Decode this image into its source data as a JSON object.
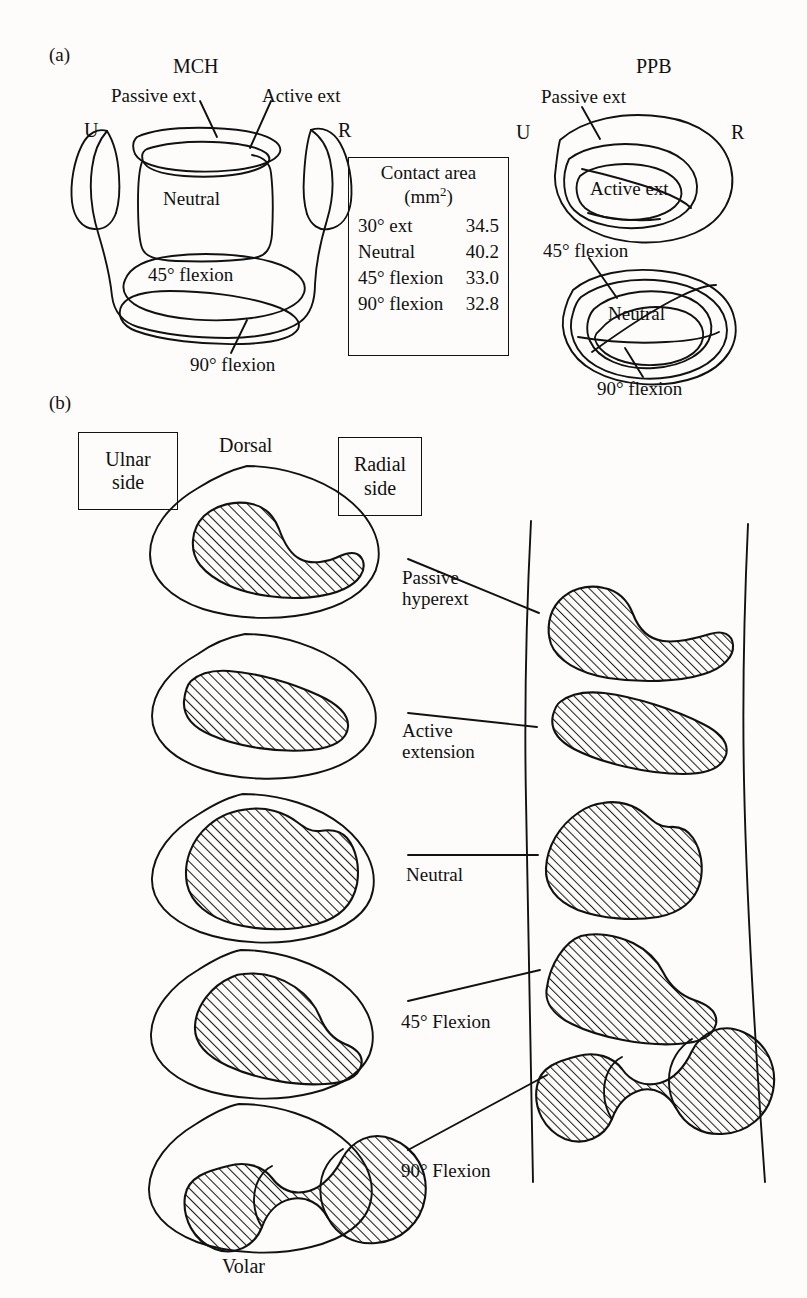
{
  "figure": {
    "panel_a_tag": "(a)",
    "panel_b_tag": "(b)"
  },
  "panel_a": {
    "left_title": "MCH",
    "right_title": "PPB",
    "mch": {
      "ulnar_marker": "U",
      "radial_marker": "R",
      "passive_ext": "Passive ext",
      "active_ext": "Active ext",
      "neutral": "Neutral",
      "flexion_45": "45° flexion",
      "flexion_90": "90° flexion"
    },
    "ppb": {
      "ulnar_marker": "U",
      "radial_marker": "R",
      "passive_ext": "Passive ext",
      "active_ext": "Active ext",
      "neutral": "Neutral",
      "flexion_45": "45° flexion",
      "flexion_90": "90° flexion"
    },
    "contact_table": {
      "title_line1": "Contact area",
      "title_line2_prefix": "(mm",
      "title_line2_sup": "2",
      "title_line2_suffix": ")",
      "rows": [
        {
          "label": "30°  ext",
          "value": "34.5"
        },
        {
          "label": "Neutral",
          "value": "40.2"
        },
        {
          "label": "45°  flexion",
          "value": "33.0"
        },
        {
          "label": "90°  flexion",
          "value": "32.8"
        }
      ]
    }
  },
  "panel_b": {
    "ulnar_box_line1": "Ulnar",
    "ulnar_box_line2": "side",
    "radial_box_line1": "Radial",
    "radial_box_line2": "side",
    "dorsal": "Dorsal",
    "volar": "Volar",
    "rows": [
      {
        "label_line1": "Passive",
        "label_line2": "hyperext"
      },
      {
        "label_line1": "Active",
        "label_line2": "extension"
      },
      {
        "label_line1": "Neutral",
        "label_line2": ""
      },
      {
        "label_line1": "45° Flexion",
        "label_line2": ""
      },
      {
        "label_line1": "90° Flexion",
        "label_line2": ""
      }
    ]
  },
  "colors": {
    "ink": "#111111",
    "paper": "#fdfcfb",
    "hatch": "#1a1a1a"
  }
}
